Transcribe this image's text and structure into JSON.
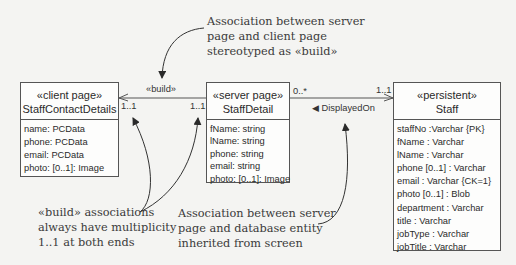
{
  "classes": {
    "client": {
      "stereotype": "«client page»",
      "name": "StaffContactDetails",
      "attributes": [
        "name: PCData",
        "phone: PCData",
        "email: PCData",
        "photo: [0..1]: Image"
      ]
    },
    "server": {
      "stereotype": "«server page»",
      "name": "StaffDetail",
      "attributes": [
        "fName: string",
        "lName: string",
        "phone: string",
        "email: string",
        "photo: [0..1]: Image"
      ]
    },
    "persistent": {
      "stereotype": "«persistent»",
      "name": "Staff",
      "attributes": [
        "staffNo :Varchar {PK}",
        "fName : Varchar",
        "lName : Varchar",
        "phone [0..1] : Varchar",
        "email : Varchar {CK=1}",
        "photo [0..1] : Blob",
        "department : Varchar",
        "title : Varchar",
        "jobType : Varchar",
        "jobTitle : Varchar"
      ]
    }
  },
  "associations": {
    "build": {
      "label": "«build»",
      "mult_client": "1..1",
      "mult_server": "1..1"
    },
    "displayed_on": {
      "label": "◀ DisplayedOn",
      "mult_server": "0..*",
      "mult_persistent": "1..1"
    }
  },
  "notes": {
    "top": [
      "Association between server",
      "page and client page",
      "stereotyped as «build»"
    ],
    "bottom_left": [
      "«build» associations",
      "always have multiplicity",
      "1..1 at both ends"
    ],
    "bottom_mid": [
      "Association between server",
      "page and database entity",
      "inherited from screen"
    ]
  }
}
